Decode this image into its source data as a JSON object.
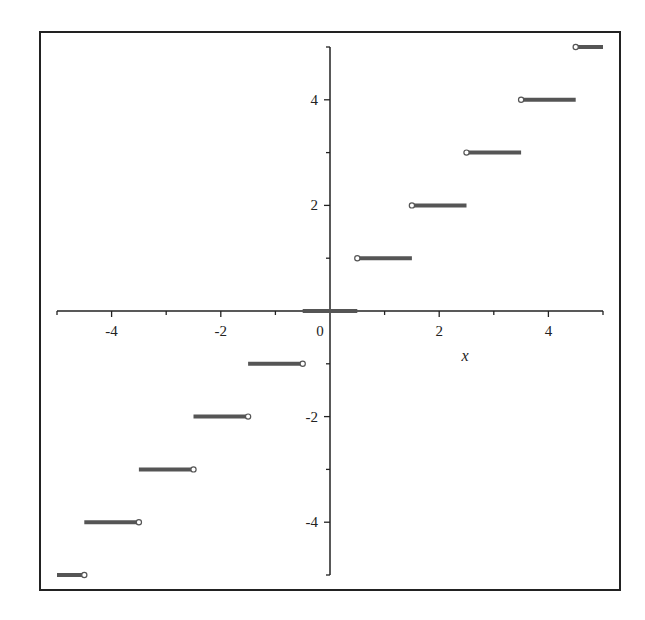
{
  "chart_data": {
    "type": "line",
    "subtype": "step",
    "title": "",
    "xlabel": "x",
    "ylabel": "",
    "xlim": [
      -5,
      5
    ],
    "ylim": [
      -5,
      5
    ],
    "grid": false,
    "legend": null,
    "x_ticks": [
      -4,
      -2,
      0,
      2,
      4
    ],
    "y_ticks": [
      -4,
      -2,
      2,
      4
    ],
    "x_tick_labels": [
      "-4",
      "-2",
      "0",
      "2",
      "4"
    ],
    "y_tick_labels": [
      "-4",
      "-2",
      "2",
      "4"
    ],
    "series": [
      {
        "name": "round(x)",
        "color": "#555555",
        "segments": [
          {
            "x0": -5.0,
            "x1": -4.5,
            "y": -5,
            "open_end": "right"
          },
          {
            "x0": -4.5,
            "x1": -3.5,
            "y": -4,
            "open_end": "right"
          },
          {
            "x0": -3.5,
            "x1": -2.5,
            "y": -3,
            "open_end": "right"
          },
          {
            "x0": -2.5,
            "x1": -1.5,
            "y": -2,
            "open_end": "right"
          },
          {
            "x0": -1.5,
            "x1": -0.5,
            "y": -1,
            "open_end": "right"
          },
          {
            "x0": -0.5,
            "x1": 0.5,
            "y": 0,
            "open_end": "none"
          },
          {
            "x0": 0.5,
            "x1": 1.5,
            "y": 1,
            "open_end": "left"
          },
          {
            "x0": 1.5,
            "x1": 2.5,
            "y": 2,
            "open_end": "left"
          },
          {
            "x0": 2.5,
            "x1": 3.5,
            "y": 3,
            "open_end": "left"
          },
          {
            "x0": 3.5,
            "x1": 4.5,
            "y": 4,
            "open_end": "left"
          },
          {
            "x0": 4.5,
            "x1": 5.0,
            "y": 5,
            "open_end": "left"
          }
        ]
      }
    ]
  },
  "colors": {
    "frame": "#222222",
    "axis": "#222222",
    "segment": "#555555"
  }
}
